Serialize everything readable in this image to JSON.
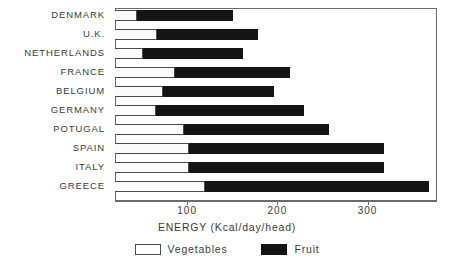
{
  "chart_data": {
    "type": "bar",
    "orientation": "horizontal",
    "stacked": true,
    "title": "",
    "xlabel": "ENERGY (Kcal/day/head)",
    "ylabel": "",
    "xlim": [
      0,
      380
    ],
    "xticks": [
      100,
      200,
      300
    ],
    "xtick_labels": [
      "100",
      "200",
      "300"
    ],
    "grid": false,
    "legend_position": "bottom-center",
    "categories": [
      "DENMARK",
      "U.K.",
      "NETHERLANDS",
      "FRANCE",
      "BELGIUM",
      "GERMANY",
      "POTUGAL",
      "SPAIN",
      "ITALY",
      "GREECE"
    ],
    "series": [
      {
        "name": "Vegetables",
        "color": "#ffffff",
        "values": [
          44,
          67,
          51,
          87,
          73,
          65,
          96,
          102,
          102,
          120
        ]
      },
      {
        "name": "Fruit",
        "color": "#141414",
        "values": [
          107,
          112,
          111,
          127,
          123,
          164,
          161,
          216,
          216,
          248
        ]
      }
    ],
    "totals": [
      151,
      179,
      162,
      214,
      196,
      229,
      257,
      318,
      318,
      368
    ]
  },
  "legend": {
    "items": [
      {
        "label": "Vegetables",
        "swatch": "white-outline-swatch"
      },
      {
        "label": "Fruit",
        "swatch": "black-swatch"
      }
    ]
  },
  "axis": {
    "title": "ENERGY (Kcal/day/head)"
  }
}
